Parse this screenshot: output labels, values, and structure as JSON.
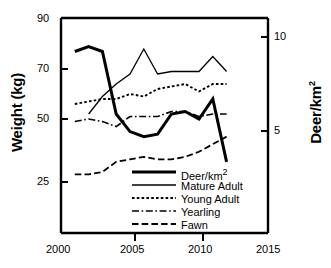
{
  "chart_data": {
    "type": "line",
    "title": "",
    "xlabel": "",
    "ylabel": "Weight (kg)",
    "ylabel_right": "Deer/km2",
    "grid": false,
    "legend_position": "bottom-center-inside",
    "xlim": [
      2000,
      2015
    ],
    "ylim": [
      25,
      90
    ],
    "ylim_right": [
      2.6,
      10.2
    ],
    "xticks": [
      2000,
      2005,
      2010,
      2015
    ],
    "xtick_labels": [
      "2000",
      "2005",
      "2010",
      "2015"
    ],
    "yticks": [
      25,
      50,
      70,
      90
    ],
    "ytick_labels": [
      "25",
      "50",
      "70",
      "90"
    ],
    "yticks_right": [
      5,
      10
    ],
    "ytick_labels_right": [
      "5",
      "10"
    ],
    "x": [
      2001,
      2002,
      2003,
      2004,
      2005,
      2006,
      2007,
      2008,
      2009,
      2010,
      2011,
      2012
    ],
    "series": [
      {
        "name": "Deer/km2",
        "style": "solid-thick",
        "axis": "right",
        "values": [
          77,
          79,
          77,
          52,
          45,
          43,
          44,
          52,
          53,
          50,
          58,
          33
        ]
      },
      {
        "name": "Mature Adult",
        "style": "solid-thin",
        "axis": "left",
        "values": [
          null,
          52,
          59,
          64,
          68,
          78,
          68,
          69,
          69,
          69,
          75,
          69
        ]
      },
      {
        "name": "Young Adult",
        "style": "dotted",
        "axis": "left",
        "values": [
          56,
          57,
          58,
          58,
          60,
          59,
          62,
          63,
          64,
          61,
          64,
          64
        ]
      },
      {
        "name": "Yearling",
        "style": "dash-dot",
        "axis": "left",
        "values": [
          49,
          50,
          49,
          47,
          51,
          51,
          51,
          53,
          53,
          51,
          52,
          52
        ]
      },
      {
        "name": "Fawn",
        "style": "dashed",
        "axis": "left",
        "values": [
          28,
          28,
          29,
          33,
          34,
          35,
          34,
          34,
          35,
          37,
          40,
          43
        ]
      }
    ]
  },
  "axes": {
    "left_title": "Weight (kg)",
    "right_title_base": "Deer/km",
    "right_title_sup": "2",
    "xtick_2000": "2000",
    "xtick_2005": "2005",
    "xtick_2010": "2010",
    "xtick_2015": "2015",
    "ytick_90": "90",
    "ytick_70": "70",
    "ytick_50": "50",
    "ytick_25": "25",
    "rtick_10": "10",
    "rtick_5": "5"
  },
  "legend": {
    "items": [
      {
        "label_base": "Deer/km",
        "label_sup": "2",
        "style": "solid-thick"
      },
      {
        "label_base": "Mature Adult",
        "label_sup": "",
        "style": "solid-thin"
      },
      {
        "label_base": "Young Adult",
        "label_sup": "",
        "style": "dotted"
      },
      {
        "label_base": "Yearling",
        "label_sup": "",
        "style": "dash-dot"
      },
      {
        "label_base": "Fawn",
        "label_sup": "",
        "style": "dashed"
      }
    ]
  }
}
